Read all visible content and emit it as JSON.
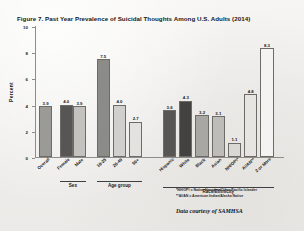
{
  "figure": {
    "title": "Figure 7. Past Year Prevalence of Suicidal Thoughts Among U.S. Adults (2014)",
    "credit": "Data courtesy of SAMHSA",
    "footnotes": [
      "*NH/OPI = Native Hawaiian/Other Pacific Islander",
      "**AI/AN = American Indian/Alaska Native"
    ]
  },
  "axes": {
    "ylabel": "Percent",
    "yticks": [
      "0",
      "2",
      "4",
      "6",
      "8",
      "10"
    ],
    "groups": [
      {
        "label": "Sex"
      },
      {
        "label": "Age group"
      },
      {
        "label": "Race/Ethnicity"
      }
    ]
  },
  "chart_data": {
    "type": "bar",
    "title": "Figure 7. Past Year Prevalence of Suicidal Thoughts Among U.S. Adults (2014)",
    "xlabel": "",
    "ylabel": "Percent",
    "ylim": [
      0,
      10
    ],
    "yticks": [
      0,
      2,
      4,
      6,
      8,
      10
    ],
    "grid": false,
    "legend": "none",
    "categories": [
      "Overall",
      "Female",
      "Male",
      "18-25",
      "26-49",
      "50+",
      "Hispanic",
      "White",
      "Black",
      "Asian",
      "NH/OPI*",
      "AI/AN**",
      "2 or More"
    ],
    "values": [
      3.9,
      4.0,
      3.9,
      7.5,
      4.0,
      2.7,
      3.6,
      4.3,
      3.2,
      3.1,
      1.1,
      4.8,
      8.3
    ],
    "value_labels": [
      "3.9",
      "4.0",
      "3.9",
      "7.5",
      "4.0",
      "2.7",
      "3.6",
      "4.3",
      "3.2",
      "3.1",
      "1.1",
      "4.8",
      "8.3"
    ],
    "bar_colors": [
      "#9a9a97",
      "#575654",
      "#c3c2bf",
      "#8b8b88",
      "#d0cfcc",
      "#e3e2df",
      "#575654",
      "#434240",
      "#a8a7a4",
      "#bdbcb9",
      "#d9d8d5",
      "#e6e5e2",
      "#f4f3f1"
    ],
    "group_spans": [
      {
        "label": "Sex",
        "from": 1,
        "to": 2
      },
      {
        "label": "Age group",
        "from": 3,
        "to": 5
      },
      {
        "label": "Race/Ethnicity",
        "from": 6,
        "to": 12
      }
    ]
  }
}
